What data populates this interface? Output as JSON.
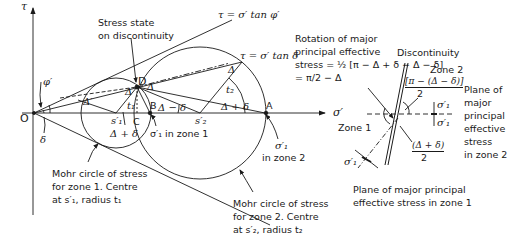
{
  "figure": {
    "left_diagram": {
      "axis_labels": {
        "tau": "τ",
        "sigma": "σ′",
        "origin": "O"
      },
      "lines": {
        "phi_line": "τ = σ′ tan φ′",
        "delta_line": "τ = σ′ tan δ"
      },
      "points": {
        "D": "D",
        "B": "B",
        "C": "C",
        "A": "A",
        "s1": "s′₁",
        "s2": "s′₂",
        "origin": "O"
      },
      "angle_labels": {
        "phi": "φ′",
        "delta": "δ",
        "Delta_1": "Δ′",
        "Delta_2": "Δ",
        "Delta_3": "Δ",
        "Delta_4": "Δ",
        "t1": "t₁",
        "t2": "t₂",
        "delta_plus_Delta_1": "Δ + δ",
        "delta_plus_Delta_2": "Δ + δ",
        "Delta_minus_delta": "Δ − δ"
      },
      "annotations": {
        "stress_state_line1": "Stress state",
        "stress_state_line2": "on discontinuity",
        "sigma1_zone1": "σ′₁ in zone 1",
        "sigma1_zone2_line1": "σ′₁",
        "sigma1_zone2_line2": "in zone 2",
        "mohr1_line1": "Mohr circle of stress",
        "mohr1_line2": "for zone 1. Centre",
        "mohr1_line3": "at s′₁, radius t₁",
        "mohr2_line1": "Mohr circle of stress",
        "mohr2_line2": "for zone 2. Centre",
        "mohr2_line3": "at s′₂, radius t₂"
      }
    },
    "right_diagram": {
      "rotation_line1": "Rotation of major",
      "rotation_line2": "principal effective",
      "rotation_line3": "stress = ½ [π − Δ + δ − Δ − δ]",
      "rotation_line4": "= π/2 − Δ",
      "discontinuity": "Discontinuity",
      "zone1": "Zone 1",
      "zone2": "Zone 2",
      "angle_top_num": "[π − (Δ − δ)]",
      "angle_top_den": "2",
      "angle_bottom_num": "(Δ + δ)",
      "angle_bottom_den": "2",
      "sigma1_a": "σ′₁",
      "sigma1_b": "σ′₁",
      "sigma1_c": "σ′₁",
      "plane_zone2_line1": "Plane of",
      "plane_zone2_line2": "major",
      "plane_zone2_line3": "principal",
      "plane_zone2_line4": "effective",
      "plane_zone2_line5": "stress",
      "plane_zone2_line6": "in zone 2",
      "plane_zone1_line1": "Plane of major principal",
      "plane_zone1_line2": "effective stress in zone 1"
    },
    "colors": {
      "ink": "#1a1a1a",
      "background": "#ffffff"
    }
  }
}
